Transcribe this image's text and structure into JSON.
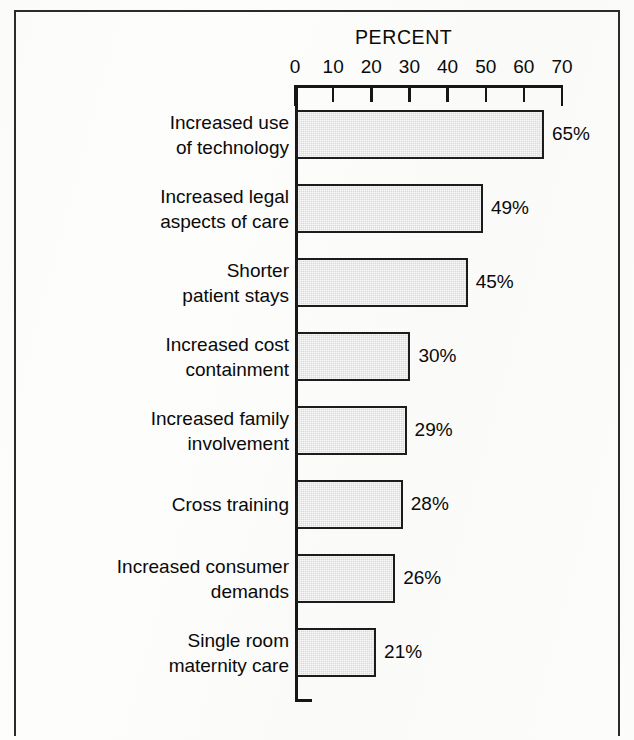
{
  "chart_data": {
    "type": "bar",
    "orientation": "horizontal",
    "title": "PERCENT",
    "xlabel": "PERCENT",
    "ylabel": "",
    "xlim": [
      0,
      70
    ],
    "xticks": [
      0,
      10,
      20,
      30,
      40,
      50,
      60,
      70
    ],
    "xtick_labels": [
      "0",
      "10",
      "20",
      "30",
      "40",
      "50",
      "60",
      "70"
    ],
    "grid": false,
    "legend": null,
    "axis_position": "top",
    "categories": [
      "Increased use of technology",
      "Increased legal aspects of care",
      "Shorter patient stays",
      "Increased cost containment",
      "Increased family involvement",
      "Cross training",
      "Increased consumer demands",
      "Single room maternity care"
    ],
    "category_lines": [
      [
        "Increased use",
        "of technology"
      ],
      [
        "Increased legal",
        "aspects of care"
      ],
      [
        "Shorter",
        "patient stays"
      ],
      [
        "Increased cost",
        "containment"
      ],
      [
        "Increased family",
        "involvement"
      ],
      [
        "Cross training"
      ],
      [
        "Increased consumer",
        "demands"
      ],
      [
        "Single room",
        "maternity care"
      ]
    ],
    "values": [
      65,
      49,
      45,
      30,
      29,
      28,
      26,
      21
    ],
    "value_labels": [
      "65%",
      "49%",
      "45%",
      "30%",
      "29%",
      "28%",
      "26%",
      "21%"
    ],
    "bar_fill_color": "#d9d9d9",
    "bar_edge_color": "#1c1c1c",
    "axis_color": "#161616",
    "background_color": "#fdfdfc"
  }
}
